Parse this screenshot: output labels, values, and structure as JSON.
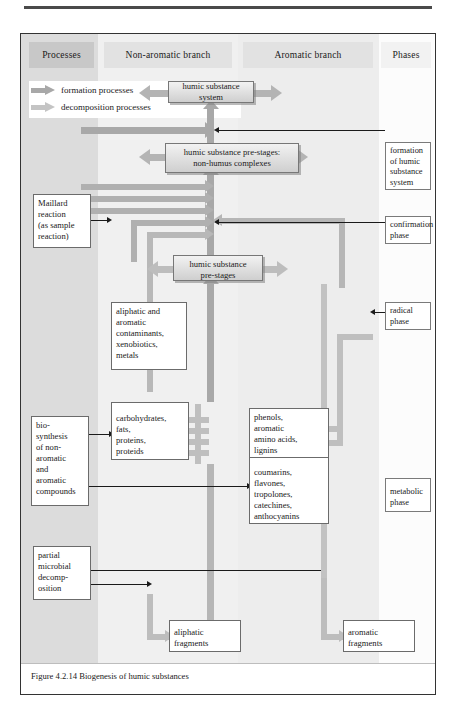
{
  "figure": {
    "caption": "Figure 4.2.14 Biogenesis of humic substances"
  },
  "colors": {
    "formation_arrow": "#a8a8a8",
    "decomposition_arrow": "#bdbdbd",
    "band_processes": "#dcdcdc",
    "band_non_aromatic": "#f0f0f0",
    "band_aromatic": "#ededed",
    "band_phases": "#fcfcfc",
    "header_processes": "#c8c8c8",
    "header_other": "#e2e2e2",
    "box_border": "#6b6b6b",
    "leader_line": "#1a1a1a"
  },
  "columns": [
    {
      "id": "processes",
      "label": "Processes"
    },
    {
      "id": "non_aromatic",
      "label": "Non-aromatic branch"
    },
    {
      "id": "aromatic",
      "label": "Aromatic branch"
    },
    {
      "id": "phases",
      "label": "Phases"
    }
  ],
  "legend": {
    "items": [
      {
        "id": "formation",
        "label": "formation processes",
        "color": "#a8a8a8"
      },
      {
        "id": "decomposition",
        "label": "decomposition processes",
        "color": "#bdbdbd"
      }
    ]
  },
  "nodes": {
    "humic_substance_system": "humic substance system",
    "pre_stages_non_humus": "humic substance pre-stages:\nnon-humus complexes",
    "pre_stages_non_humus_line1": "humic substance pre-stages:",
    "pre_stages_non_humus_line2": "non-humus complexes",
    "pre_stages_line1": "humic substance",
    "pre_stages_line2": "pre-stages",
    "maillard": "Maillard\nreaction\n(as sample\nreaction)",
    "maillard_l1": "Maillard",
    "maillard_l2": "reaction",
    "maillard_l3": "(as sample",
    "maillard_l4": "reaction)",
    "contaminants": "aliphatic and\naromatic\ncontaminants,\nxenobiotics,\nmetals",
    "contaminants_l1": "aliphatic and",
    "contaminants_l2": "aromatic",
    "contaminants_l3": "contaminants,",
    "contaminants_l4": "xenobiotics,",
    "contaminants_l5": "metals",
    "carbohydrates": "carbohydrates,\nfats,\nproteins,\nproteids",
    "carbohydrates_l1": "carbohydrates,",
    "carbohydrates_l2": "fats,",
    "carbohydrates_l3": "proteins,",
    "carbohydrates_l4": "proteids",
    "phenols": "phenols,\naromatic\namino acids,\nlignins",
    "phenols_l1": "phenols,",
    "phenols_l2": "aromatic",
    "phenols_l3": "amino acids,",
    "phenols_l4": "lignins",
    "coumarins": "coumarins,\nflavones,\ntropolones,\ncatechines,\nanthocyanins",
    "coumarins_l1": "coumarins,",
    "coumarins_l2": "flavones,",
    "coumarins_l3": "tropolones,",
    "coumarins_l4": "catechines,",
    "coumarins_l5": "anthocyanins",
    "biosynthesis": "bio-\nsynthesis\nof non-\naromatic\nand\naromatic\ncompounds",
    "biosynthesis_l1": "bio-",
    "biosynthesis_l2": "synthesis",
    "biosynthesis_l3": "of non-",
    "biosynthesis_l4": "aromatic",
    "biosynthesis_l5": "and",
    "biosynthesis_l6": "aromatic",
    "biosynthesis_l7": "compounds",
    "microbial": "partial\nmicrobial\ndecomp-\nosition",
    "microbial_l1": "partial",
    "microbial_l2": "microbial",
    "microbial_l3": "decomp-",
    "microbial_l4": "osition",
    "aliphatic_fragments_l1": "aliphatic",
    "aliphatic_fragments_l2": "fragments",
    "aromatic_fragments_l1": "aromatic",
    "aromatic_fragments_l2": "fragments"
  },
  "phases": [
    {
      "id": "formation_of_humic_substance_system",
      "lines": [
        "formation",
        "of humic",
        "substance",
        "system"
      ],
      "l1": "formation",
      "l2": "of humic",
      "l3": "substance",
      "l4": "system"
    },
    {
      "id": "confirmation_phase",
      "lines": [
        "confirmation",
        "phase"
      ],
      "l1": "confirmation",
      "l2": "phase"
    },
    {
      "id": "radical_phase",
      "lines": [
        "radical",
        "phase"
      ],
      "l1": "radical",
      "l2": "phase"
    },
    {
      "id": "metabolic_phase",
      "lines": [
        "metabolic",
        "phase"
      ],
      "l1": "metabolic",
      "l2": "phase"
    }
  ]
}
